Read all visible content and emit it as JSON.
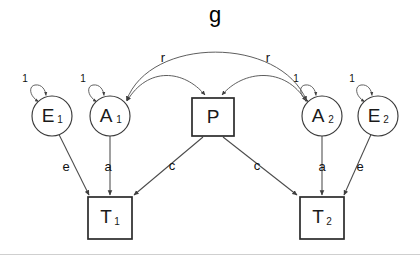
{
  "diagram": {
    "background_color": "#ffffff",
    "stroke_color": "#4a4a4a",
    "label_color": "#111111",
    "nodes": [
      {
        "id": "E1",
        "kind": "circle",
        "label": "E",
        "subscript": "1",
        "cx": 52,
        "cy": 116,
        "r": 20
      },
      {
        "id": "A1",
        "kind": "circle",
        "label": "A",
        "subscript": "1",
        "cx": 110,
        "cy": 116,
        "r": 20
      },
      {
        "id": "P",
        "kind": "box",
        "label": "P",
        "subscript": "",
        "cx": 213,
        "cy": 117,
        "w": 42,
        "h": 38
      },
      {
        "id": "A2",
        "kind": "circle",
        "label": "A",
        "subscript": "2",
        "cx": 322,
        "cy": 116,
        "r": 20
      },
      {
        "id": "E2",
        "kind": "circle",
        "label": "E",
        "subscript": "2",
        "cx": 378,
        "cy": 116,
        "r": 20
      },
      {
        "id": "T1",
        "kind": "box",
        "label": "T",
        "subscript": "1",
        "cx": 110,
        "cy": 218,
        "w": 44,
        "h": 42
      },
      {
        "id": "T2",
        "kind": "box",
        "label": "T",
        "subscript": "2",
        "cx": 322,
        "cy": 218,
        "w": 44,
        "h": 42
      }
    ],
    "variance_loops": [
      {
        "id": "loop-E1",
        "target": "E1",
        "label": "1",
        "label_x": 25,
        "label_y": 82
      },
      {
        "id": "loop-A1",
        "target": "A1",
        "label": "1",
        "label_x": 83,
        "label_y": 82
      },
      {
        "id": "loop-A2",
        "target": "A2",
        "label": "1",
        "label_x": 296,
        "label_y": 82
      },
      {
        "id": "loop-E2",
        "target": "E2",
        "label": "1",
        "label_x": 352,
        "label_y": 82
      }
    ],
    "paths": [
      {
        "id": "path-e1-t1",
        "from": "E1",
        "to": "T1",
        "label": "e",
        "label_x": 66,
        "label_y": 171,
        "arrow": "single"
      },
      {
        "id": "path-a1-t1",
        "from": "A1",
        "to": "T1",
        "label": "a",
        "label_x": 108,
        "label_y": 171,
        "arrow": "single"
      },
      {
        "id": "path-p-t1",
        "from": "P",
        "to": "T1",
        "label": "c",
        "label_x": 172,
        "label_y": 170,
        "arrow": "single"
      },
      {
        "id": "path-p-t2",
        "from": "P",
        "to": "T2",
        "label": "c",
        "label_x": 257,
        "label_y": 170,
        "arrow": "single"
      },
      {
        "id": "path-a2-t2",
        "from": "A2",
        "to": "T2",
        "label": "a",
        "label_x": 322,
        "label_y": 171,
        "arrow": "single"
      },
      {
        "id": "path-e2-t2",
        "from": "E2",
        "to": "T2",
        "label": "e",
        "label_x": 360,
        "label_y": 171,
        "arrow": "single"
      }
    ],
    "correlations": [
      {
        "id": "corr-a1-a2",
        "between": [
          "A1",
          "A2"
        ],
        "label": "g",
        "label_x": 215,
        "label_y": 22,
        "arrow": "double"
      },
      {
        "id": "corr-a1-p",
        "between": [
          "A1",
          "P"
        ],
        "label": "r",
        "label_x": 163,
        "label_y": 62,
        "arrow": "double"
      },
      {
        "id": "corr-a2-p",
        "between": [
          "A2",
          "P"
        ],
        "label": "r",
        "label_x": 268,
        "label_y": 62,
        "arrow": "double"
      }
    ]
  }
}
